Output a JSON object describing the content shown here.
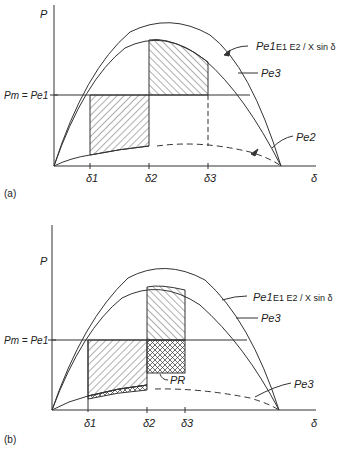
{
  "panel_a": {
    "label": "(a)",
    "y_axis": "P",
    "x_axis": "δ",
    "pm_label": "Pm = Pe1",
    "ticks": [
      "δ1",
      "δ2",
      "δ3"
    ],
    "curves": {
      "pe1": {
        "name": "Pe1",
        "formula": "E1 E2 / X sin δ"
      },
      "pe3": {
        "name": "Pe3"
      },
      "pe2": {
        "name": "Pe2"
      }
    }
  },
  "panel_b": {
    "label": "(b)",
    "y_axis": "P",
    "x_axis": "δ",
    "pm_label": "Pm = Pe1",
    "ticks": [
      "δ1",
      "δ2",
      "δ3"
    ],
    "pr_label": "PR",
    "curves": {
      "pe1": {
        "name": "Pe1",
        "formula": "E1 E2 / X sin δ"
      },
      "pe3_upper": {
        "name": "Pe3"
      },
      "pe3_lower": {
        "name": "Pe3"
      }
    }
  }
}
